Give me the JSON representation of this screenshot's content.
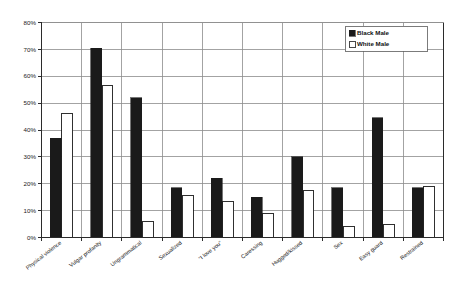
{
  "chart_data": {
    "type": "bar",
    "title": "",
    "subtitle": "",
    "xlabel": "",
    "ylabel": "",
    "ylim": [
      0,
      80
    ],
    "ytick_labels": [
      "0%",
      "10%",
      "20%",
      "30%",
      "40%",
      "50%",
      "60%",
      "70%",
      "80%"
    ],
    "ytick_values": [
      0,
      10,
      20,
      30,
      40,
      50,
      60,
      70,
      80
    ],
    "grid": true,
    "legend_position": "top-right",
    "categories": [
      "Physical violence",
      "Vulgar profanity",
      "Ungrammatical",
      "Sexualized",
      "\"I love you\"",
      "Caressing",
      "Hugged/kissed",
      "Sex",
      "Easy guard",
      "Restrained"
    ],
    "series": [
      {
        "name": "Black Male",
        "color": "#1a1a1a",
        "values": [
          37,
          70.5,
          52,
          18.5,
          22,
          15,
          30,
          18.5,
          44.5,
          18.5
        ]
      },
      {
        "name": "White Male",
        "color": "#ffffff",
        "values": [
          46,
          56.5,
          6,
          15.5,
          13.5,
          9,
          17.5,
          4,
          5,
          19
        ]
      }
    ]
  },
  "legend": {
    "entries": [
      {
        "label": "Black Male",
        "swatch": "filled-square"
      },
      {
        "label": "White Male",
        "swatch": "open-square"
      }
    ]
  },
  "colors": {
    "series_black": "#1a1a1a",
    "series_white": "#ffffff",
    "axis": "#2b2b2b",
    "grid": "#8c8c8c",
    "background": "#ffffff"
  }
}
